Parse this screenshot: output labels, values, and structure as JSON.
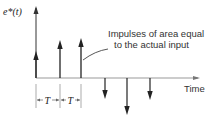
{
  "diagram": {
    "y_axis_label": "e*(t)",
    "x_axis_label": "Time",
    "annotation_line1": "Impulses of area equal",
    "annotation_line2": "to the actual input",
    "period_label_1": "T",
    "period_label_2": "T",
    "impulses": [
      {
        "x": 36,
        "direction": "up",
        "tip_y": 53
      },
      {
        "x": 60,
        "direction": "up",
        "tip_y": 42
      },
      {
        "x": 81,
        "direction": "up",
        "tip_y": 40
      },
      {
        "x": 105,
        "direction": "down",
        "tip_y": 97
      },
      {
        "x": 127,
        "direction": "down",
        "tip_y": 113
      },
      {
        "x": 150,
        "direction": "down",
        "tip_y": 98
      }
    ]
  }
}
